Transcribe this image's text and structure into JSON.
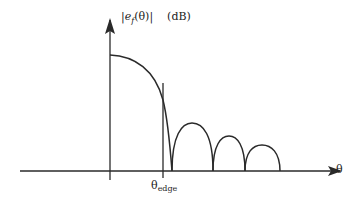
{
  "diagram": {
    "y_axis": {
      "label_main": "|e",
      "label_sub": "f",
      "label_arg": "(θ)|",
      "label_unit": "(dB)"
    },
    "x_axis": {
      "label": "θ"
    },
    "marker": {
      "label_main": "θ",
      "label_sub": "edge"
    },
    "colors": {
      "line": "#2a2a2a",
      "background": "#ffffff"
    },
    "curve": {
      "main_lobe": "decreasing from peak at θ=0 to first null just past θ_edge",
      "side_lobes": [
        {
          "start_x": 172,
          "end_x": 213,
          "peak_y": 123
        },
        {
          "start_x": 213,
          "end_x": 245,
          "peak_y": 136
        },
        {
          "start_x": 245,
          "end_x": 280,
          "peak_y": 145
        }
      ]
    }
  }
}
